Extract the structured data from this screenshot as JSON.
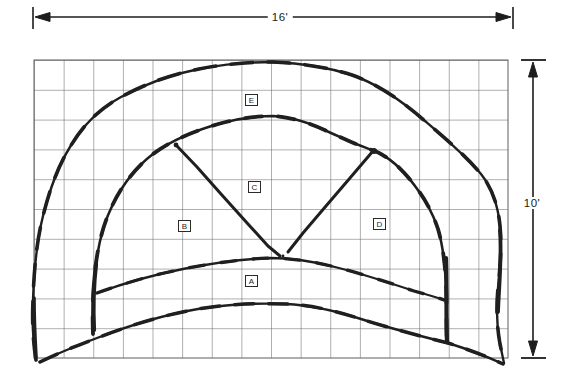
{
  "figure": {
    "dimension_width_label": "16'",
    "dimension_height_label": "10'",
    "grid": {
      "columns": 16,
      "rows": 10
    },
    "regions": [
      {
        "label": "A"
      },
      {
        "label": "B"
      },
      {
        "label": "C"
      },
      {
        "label": "D"
      },
      {
        "label": "E"
      }
    ],
    "colors": {
      "ink": "#1f1f1f",
      "grid_line": "#5f5f5f",
      "background": "#ffffff"
    }
  }
}
